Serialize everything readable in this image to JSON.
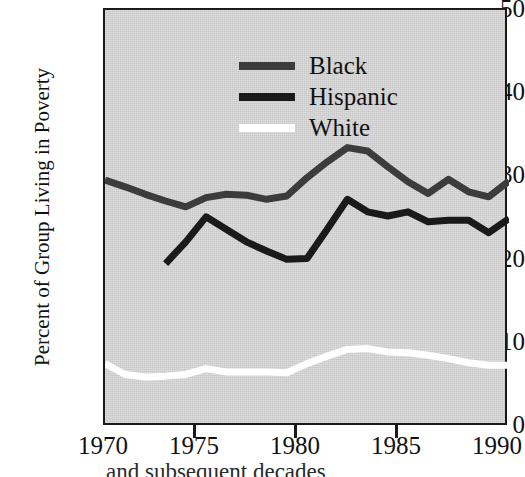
{
  "chart_data": {
    "type": "line",
    "title": "",
    "xlabel": "",
    "ylabel": "Percent of Group Living in Poverty",
    "xlim": [
      1970,
      1990
    ],
    "ylim": [
      0,
      50
    ],
    "xticks": [
      1970,
      1975,
      1980,
      1985,
      1990
    ],
    "yticks": [
      0,
      10,
      20,
      30,
      40,
      50
    ],
    "grid": false,
    "legend_position": "upper-left-inside",
    "background_color": "#c9c9c9",
    "frame_color": "#1a1a1a",
    "series": [
      {
        "name": "Black",
        "color": "#3c3c3c",
        "x": [
          1970,
          1971,
          1972,
          1973,
          1974,
          1975,
          1976,
          1977,
          1978,
          1979,
          1980,
          1981,
          1982,
          1983,
          1984,
          1985,
          1986,
          1987,
          1988,
          1989,
          1990
        ],
        "values": [
          29.6,
          28.8,
          27.9,
          27.1,
          26.4,
          27.5,
          27.9,
          27.8,
          27.3,
          27.7,
          29.9,
          31.8,
          33.5,
          33.1,
          31.2,
          29.4,
          28.0,
          29.7,
          28.2,
          27.6,
          29.5
        ]
      },
      {
        "name": "Hispanic",
        "color": "#1a1a1a",
        "x": [
          1973,
          1974,
          1975,
          1976,
          1977,
          1978,
          1979,
          1980,
          1981,
          1982,
          1983,
          1984,
          1985,
          1986,
          1987,
          1988,
          1989,
          1990
        ],
        "values": [
          19.6,
          22.2,
          25.2,
          23.7,
          22.2,
          21.1,
          20.1,
          20.2,
          23.7,
          27.3,
          25.8,
          25.3,
          25.8,
          24.6,
          24.8,
          24.8,
          23.3,
          25.0
        ]
      },
      {
        "name": "White",
        "color": "#ffffff",
        "x": [
          1970,
          1971,
          1972,
          1973,
          1974,
          1975,
          1976,
          1977,
          1978,
          1979,
          1980,
          1981,
          1982,
          1983,
          1984,
          1985,
          1986,
          1987,
          1988,
          1989,
          1990
        ],
        "values": [
          7.6,
          6.3,
          6.0,
          6.1,
          6.3,
          7.0,
          6.6,
          6.6,
          6.6,
          6.5,
          7.6,
          8.5,
          9.3,
          9.4,
          9.0,
          8.9,
          8.6,
          8.2,
          7.7,
          7.4,
          7.4
        ]
      }
    ]
  },
  "legend": {
    "items": [
      {
        "label": "Black",
        "color": "#3c3c3c"
      },
      {
        "label": "Hispanic",
        "color": "#1a1a1a"
      },
      {
        "label": "White",
        "color": "#ffffff"
      }
    ]
  },
  "axes": {
    "y_label": "Percent of Group Living in Poverty",
    "y_ticks": [
      "50",
      "40",
      "30",
      "20",
      "10",
      "0"
    ],
    "x_ticks": [
      "1970",
      "1975",
      "1980",
      "1985",
      "1990"
    ]
  },
  "caption": {
    "clipped_text": "and subsequent decades"
  }
}
